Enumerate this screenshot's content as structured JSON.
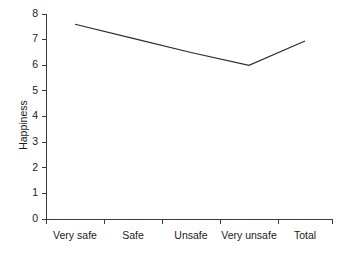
{
  "chart_data": {
    "type": "line",
    "title": "",
    "xlabel": "",
    "ylabel": "Happiness",
    "categories": [
      "Very safe",
      "Safe",
      "Unsafe",
      "Very unsafe",
      "Total"
    ],
    "values": [
      7.6,
      7.05,
      6.5,
      6.0,
      6.95
    ],
    "series": [
      {
        "name": "Happiness",
        "values": [
          7.6,
          7.05,
          6.5,
          6.0,
          6.95
        ]
      }
    ],
    "ylim": [
      0,
      8
    ],
    "yticks": [
      0,
      1,
      2,
      3,
      4,
      5,
      6,
      7,
      8
    ],
    "ytick_labels": [
      "0",
      "1",
      "2",
      "3",
      "4",
      "5",
      "6",
      "7",
      "8"
    ],
    "grid": false,
    "legend": false,
    "legend_position": "none",
    "line_color": "#2b2b2b",
    "axis_color": "#3a3a3a",
    "background_color": "#ffffff",
    "markers": false
  },
  "axis": {
    "y_label": "Happiness",
    "y_ticks": [
      "0",
      "1",
      "2",
      "3",
      "4",
      "5",
      "6",
      "7",
      "8"
    ],
    "x_categories": [
      "Very safe",
      "Safe",
      "Unsafe",
      "Very unsafe",
      "Total"
    ]
  }
}
